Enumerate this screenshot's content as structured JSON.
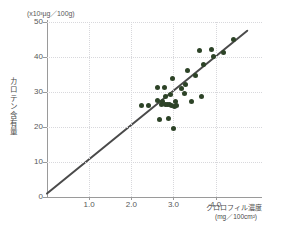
{
  "chart_data": {
    "type": "scatter",
    "title": "",
    "xlabel": "クロロフィル濃度",
    "xlabel_unit": "(mg／100cm²)",
    "ylabel": "カロテン含有量",
    "ylabel_unit": "(x10³µg／100g)",
    "xlim": [
      0,
      5.1
    ],
    "ylim": [
      0,
      50
    ],
    "xticks": [
      1.0,
      2.0,
      3.0,
      4.0
    ],
    "xtick_labels": [
      "1.0",
      "2.0",
      "3.0",
      "4.0"
    ],
    "yticks": [
      0,
      10,
      20,
      30,
      40,
      50
    ],
    "ytick_labels": [
      "0",
      "10",
      "20",
      "30",
      "40",
      "50"
    ],
    "grid": true,
    "legend": "none",
    "point_color": "#2d4327",
    "line_color": "#4a4a4a",
    "axis_color": "#9a9a9a",
    "grid_color": "#d8d8dc",
    "trend_line": {
      "x_start": 0.0,
      "y_start": 1.0,
      "x_end": 4.75,
      "y_end": 47.5
    },
    "points": [
      {
        "x": 2.25,
        "y": 26.2
      },
      {
        "x": 2.4,
        "y": 26.1
      },
      {
        "x": 2.62,
        "y": 27.6
      },
      {
        "x": 2.63,
        "y": 31.2
      },
      {
        "x": 2.67,
        "y": 22.1
      },
      {
        "x": 2.72,
        "y": 26.5
      },
      {
        "x": 2.75,
        "y": 27.3
      },
      {
        "x": 2.78,
        "y": 31.4
      },
      {
        "x": 2.8,
        "y": 26.4
      },
      {
        "x": 2.82,
        "y": 28.6
      },
      {
        "x": 2.85,
        "y": 26.3
      },
      {
        "x": 2.88,
        "y": 22.5
      },
      {
        "x": 2.9,
        "y": 26.3
      },
      {
        "x": 2.92,
        "y": 29.4
      },
      {
        "x": 2.95,
        "y": 26.2
      },
      {
        "x": 2.98,
        "y": 33.8
      },
      {
        "x": 3.0,
        "y": 19.7
      },
      {
        "x": 3.02,
        "y": 26.0
      },
      {
        "x": 3.05,
        "y": 27.2
      },
      {
        "x": 3.08,
        "y": 26.2
      },
      {
        "x": 3.18,
        "y": 30.9
      },
      {
        "x": 3.25,
        "y": 29.7
      },
      {
        "x": 3.28,
        "y": 32.2
      },
      {
        "x": 3.33,
        "y": 36.1
      },
      {
        "x": 3.42,
        "y": 27.4
      },
      {
        "x": 3.52,
        "y": 34.6
      },
      {
        "x": 3.62,
        "y": 41.8
      },
      {
        "x": 3.66,
        "y": 28.8
      },
      {
        "x": 3.72,
        "y": 37.9
      },
      {
        "x": 3.9,
        "y": 42.2
      },
      {
        "x": 3.95,
        "y": 40.2
      },
      {
        "x": 4.18,
        "y": 41.2
      },
      {
        "x": 4.42,
        "y": 45.1
      }
    ]
  }
}
